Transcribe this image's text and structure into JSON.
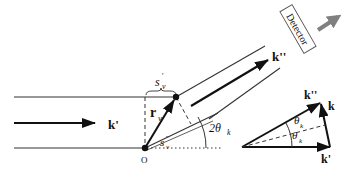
{
  "diagram": {
    "colors": {
      "ink": "#111111",
      "detector_arrow": "#808080",
      "background": "#ffffff"
    },
    "labels": {
      "incident_wavevector": "k'",
      "scattered_wavevector": "k''",
      "scattering_vector": "k",
      "position_vector": "r",
      "position_subscript": "ν",
      "path_incident": "s",
      "path_incident_sup": "'",
      "path_incident_sub": "ν",
      "path_scattered": "s",
      "path_scattered_sup": "''",
      "path_scattered_sub": "ν",
      "origin": "O",
      "angle_2theta": "2θ",
      "angle_2theta_sub": "k",
      "theta_upper": "θ",
      "theta_upper_sub": "k",
      "theta_lower": "θ",
      "theta_lower_sub": "k",
      "detector": "Detector",
      "tri_k_double_prime": "k''",
      "tri_k": "k",
      "tri_k_prime": "k'"
    }
  }
}
